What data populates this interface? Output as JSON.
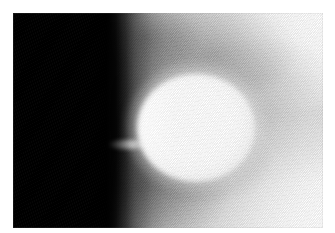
{
  "page": {
    "width": 335,
    "height": 233,
    "background_color": "#ffffff",
    "margin_px": 13
  },
  "image": {
    "name": "mammogram-crop",
    "modality": "mammography",
    "caption": "",
    "plate": {
      "left": 13,
      "top": 13,
      "width": 310,
      "height": 215
    },
    "regions": [
      {
        "name": "air-background",
        "label": "",
        "description": "pure black region occupying the left third of the frame",
        "color": "#000000",
        "extent_pct": {
          "x0": 0,
          "y0": 0,
          "x1": 33,
          "y1": 100
        }
      },
      {
        "name": "skin-line-gradient",
        "label": "",
        "description": "sharp vertical black-to-gray transition at the breast edge",
        "color_from": "#000000",
        "color_to": "#9b9b9b",
        "extent_pct": {
          "x0": 30,
          "y0": 0,
          "x1": 46,
          "y1": 100
        }
      },
      {
        "name": "fibroglandular-tissue",
        "label": "",
        "description": "mid to light gray mottled parenchyma filling the right two thirds",
        "color": "#c8c8c8",
        "extent_pct": {
          "x0": 40,
          "y0": 0,
          "x1": 100,
          "y1": 100
        }
      },
      {
        "name": "bright-peripheral-tissue",
        "label": "",
        "description": "near-white tissue at the upper-right and lower-right corners",
        "color": "#f6f6f6",
        "extent_pct": {
          "x0": 72,
          "y0": 0,
          "x1": 100,
          "y1": 100
        }
      },
      {
        "name": "dark-tissue-band",
        "label": "",
        "description": "darker gray curved band sweeping below and left of the mass",
        "color": "#8f8f8f",
        "extent_pct": {
          "x0": 26,
          "y0": 60,
          "x1": 70,
          "y1": 100
        }
      }
    ],
    "findings": [
      {
        "name": "dense-mass",
        "label": "",
        "description": "bright, dense, well circumscribed round-oval mass",
        "color": "#ffffff",
        "center_px": {
          "x": 196,
          "y": 128
        },
        "size_px": {
          "width": 118,
          "height": 108
        }
      },
      {
        "name": "bright-streak",
        "label": "",
        "description": "small bright linear density extending toward the skin line",
        "color": "#ffffff",
        "center_px": {
          "x": 128,
          "y": 144
        },
        "size_px": {
          "width": 40,
          "height": 9
        }
      }
    ],
    "texture": {
      "name": "halftone-scan-grain",
      "description": "fine diagonal halftone / scanned-film grain across the tissue",
      "angle_deg": 58
    }
  }
}
